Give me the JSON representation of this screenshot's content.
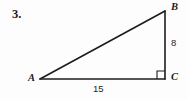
{
  "figure": {
    "problem_number": "3.",
    "type": "right-triangle",
    "vertices": [
      {
        "id": "A",
        "label": "A",
        "x": 40,
        "y": 79,
        "angle_marker": false
      },
      {
        "id": "B",
        "label": "B",
        "x": 165,
        "y": 11,
        "angle_marker": false
      },
      {
        "id": "C",
        "label": "C",
        "x": 165,
        "y": 79,
        "angle_marker": true
      }
    ],
    "sides": [
      {
        "id": "AB",
        "from": "A",
        "to": "B",
        "label": ""
      },
      {
        "id": "BC",
        "from": "B",
        "to": "C",
        "label": "8"
      },
      {
        "id": "AC",
        "from": "A",
        "to": "C",
        "label": "15"
      }
    ],
    "measures": {
      "leg_bc": "8",
      "leg_ac": "15"
    },
    "right_angle_at": "C",
    "colors": {
      "stroke": "#1c1c1c",
      "text": "#1c1c1c",
      "background": "#fdfdfd"
    }
  }
}
